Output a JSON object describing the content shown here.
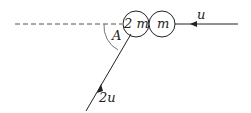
{
  "diagram": {
    "particles": [
      {
        "label": "2 m",
        "cx": 136,
        "cy": 24,
        "r": 13
      },
      {
        "label": "m",
        "cx": 162,
        "cy": 24,
        "r": 13
      }
    ],
    "velocity_labels": {
      "right": "u",
      "lower": "2u"
    },
    "angle_label": "A",
    "colors": {
      "stroke": "#222222",
      "dash": "#555555"
    }
  }
}
